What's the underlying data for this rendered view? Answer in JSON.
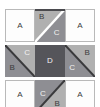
{
  "diagram": {
    "type": "tile-grid",
    "rows": 3,
    "cols": 3,
    "palette": {
      "white": "#fdfdfd",
      "light_gray": "#b0b0b0",
      "mid_gray": "#8e8e93",
      "dark_gray": "#55555a",
      "border": "#b9b9b9",
      "diagonal_dark": "#3a3a3c",
      "diagonal_light": "#ffffff",
      "label_dark": "#3c3c3c",
      "label_light": "#f2f2f2"
    },
    "tiles": [
      {
        "position": "top-left",
        "style": "plain",
        "labels": [
          {
            "text": "A",
            "anchor": "center",
            "tone": "dark"
          }
        ]
      },
      {
        "position": "top-center",
        "style": "split-diagonal-tlbr",
        "divider": "light",
        "labels": [
          {
            "text": "B",
            "anchor": "upper-left",
            "tone": "dark"
          },
          {
            "text": "C",
            "anchor": "lower-right",
            "tone": "light"
          }
        ]
      },
      {
        "position": "top-right",
        "style": "plain",
        "labels": [
          {
            "text": "A",
            "anchor": "center",
            "tone": "dark"
          }
        ]
      },
      {
        "position": "middle-left",
        "style": "split-diagonal-tlbr",
        "divider": "dark",
        "labels": [
          {
            "text": "C",
            "anchor": "upper-right",
            "tone": "light"
          },
          {
            "text": "B",
            "anchor": "lower-left",
            "tone": "dark"
          }
        ]
      },
      {
        "position": "middle-center",
        "style": "solid",
        "labels": [
          {
            "text": "D",
            "anchor": "center",
            "tone": "light"
          }
        ]
      },
      {
        "position": "middle-right",
        "style": "split-diagonal-tlbr",
        "divider": "dark",
        "labels": [
          {
            "text": "B",
            "anchor": "upper-right",
            "tone": "dark"
          },
          {
            "text": "C",
            "anchor": "lower-left",
            "tone": "light"
          }
        ]
      },
      {
        "position": "bottom-left",
        "style": "plain",
        "labels": [
          {
            "text": "A",
            "anchor": "center",
            "tone": "dark"
          }
        ]
      },
      {
        "position": "bottom-center",
        "style": "split-diagonal-trbl",
        "divider": "dark",
        "labels": [
          {
            "text": "C",
            "anchor": "upper-left",
            "tone": "light"
          },
          {
            "text": "B",
            "anchor": "lower-right",
            "tone": "dark"
          }
        ]
      },
      {
        "position": "bottom-right",
        "style": "plain",
        "labels": [
          {
            "text": "A",
            "anchor": "center",
            "tone": "dark"
          }
        ]
      }
    ]
  }
}
